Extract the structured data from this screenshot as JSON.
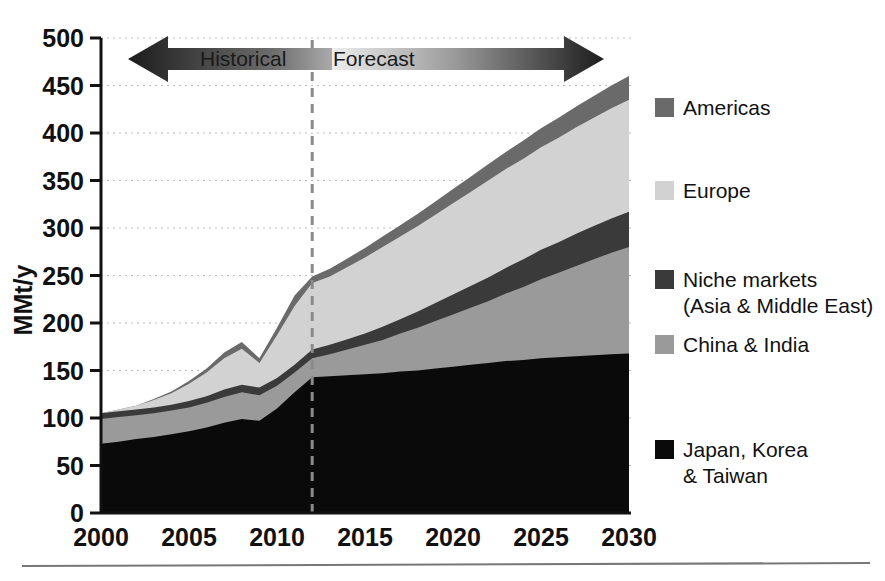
{
  "chart_data": {
    "type": "area",
    "stacked": true,
    "title": "",
    "xlabel": "",
    "ylabel": "MMt/y",
    "ylim": [
      0,
      500
    ],
    "xlim": [
      2000,
      2030
    ],
    "ytick_values": [
      0,
      50,
      100,
      150,
      200,
      250,
      300,
      350,
      400,
      450,
      500
    ],
    "ytick_labels": [
      "0",
      "50",
      "100",
      "150",
      "200",
      "250",
      "300",
      "350",
      "400",
      "450",
      "500"
    ],
    "xtick_values": [
      2000,
      2005,
      2010,
      2015,
      2020,
      2025,
      2030
    ],
    "xtick_labels": [
      "2000",
      "2005",
      "2010",
      "2015",
      "2020",
      "2025",
      "2030"
    ],
    "grid": true,
    "grid_style": "dotted",
    "legend_position": "right",
    "x": [
      2000,
      2001,
      2002,
      2003,
      2004,
      2005,
      2006,
      2007,
      2008,
      2009,
      2010,
      2011,
      2012,
      2013,
      2014,
      2015,
      2016,
      2017,
      2018,
      2019,
      2020,
      2021,
      2022,
      2023,
      2024,
      2025,
      2026,
      2027,
      2028,
      2029,
      2030
    ],
    "series": [
      {
        "name": "Japan, Korea & Taiwan",
        "color": "#0a0a0a",
        "values": [
          73,
          75,
          78,
          80,
          83,
          86,
          90,
          95,
          99,
          97,
          110,
          127,
          143,
          144,
          145,
          146,
          147,
          149,
          150,
          152,
          154,
          156,
          158,
          160,
          161,
          163,
          164,
          165,
          166,
          167,
          168
        ]
      },
      {
        "name": "China & India",
        "color": "#9a9a9a",
        "values": [
          26,
          26,
          25,
          25,
          25,
          25,
          26,
          27,
          28,
          27,
          24,
          21,
          20,
          23,
          27,
          31,
          35,
          40,
          45,
          50,
          55,
          60,
          65,
          71,
          77,
          83,
          89,
          95,
          101,
          107,
          112
        ]
      },
      {
        "name": "Niche markets (Asia & Middle East)",
        "color": "#3a3a3a",
        "values": [
          6,
          6,
          6,
          6,
          6,
          7,
          7,
          8,
          8,
          8,
          8,
          8,
          9,
          10,
          11,
          12,
          14,
          15,
          17,
          19,
          21,
          23,
          25,
          27,
          29,
          31,
          32,
          34,
          35,
          36,
          37
        ]
      },
      {
        "name": "Europe",
        "color": "#d2d2d2",
        "values": [
          0,
          2,
          4,
          8,
          12,
          18,
          25,
          33,
          38,
          26,
          45,
          62,
          70,
          72,
          76,
          80,
          84,
          87,
          90,
          93,
          96,
          99,
          102,
          104,
          106,
          108,
          110,
          112,
          114,
          116,
          118
        ]
      },
      {
        "name": "Americas",
        "color": "#6a6a6a",
        "values": [
          0,
          0,
          0,
          1,
          2,
          3,
          4,
          6,
          7,
          5,
          8,
          11,
          7,
          8,
          9,
          10,
          11,
          12,
          13,
          14,
          15,
          16,
          17,
          18,
          19,
          20,
          21,
          22,
          23,
          24,
          25
        ]
      }
    ],
    "totals": [
      105,
      109,
      113,
      120,
      128,
      139,
      152,
      169,
      180,
      163,
      195,
      229,
      249,
      257,
      268,
      279,
      291,
      303,
      315,
      328,
      341,
      354,
      367,
      380,
      392,
      405,
      416,
      428,
      439,
      450,
      460
    ],
    "forecast_divider_year": 2012,
    "annotations": {
      "historical_label": "Historical",
      "forecast_label": "Forecast"
    }
  },
  "legend": {
    "items": [
      {
        "label": "Americas",
        "label2": "",
        "color": "#6a6a6a"
      },
      {
        "label": "Europe",
        "label2": "",
        "color": "#d2d2d2"
      },
      {
        "label": "Niche markets",
        "label2": "(Asia & Middle East)",
        "color": "#3a3a3a"
      },
      {
        "label": "China & India",
        "label2": "",
        "color": "#9a9a9a"
      },
      {
        "label": "Japan, Korea",
        "label2": "& Taiwan",
        "color": "#0a0a0a"
      }
    ]
  },
  "axis": {
    "y_title": "MMt/y"
  },
  "banner": {
    "historical": "Historical",
    "forecast": "Forecast"
  }
}
